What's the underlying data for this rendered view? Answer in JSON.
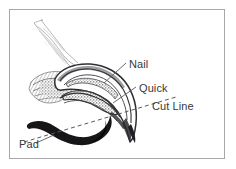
{
  "figure": {
    "background_color": "#ffffff",
    "frame_color": "#a8a8a8",
    "ink_color": "#39393c",
    "labels": {
      "nail": "Nail",
      "quick": "Quick",
      "cut_line": "Cut Line",
      "pad": "Pad"
    },
    "parts": {
      "nail_icon": "nail-shell-outline",
      "quick_icon": "quick-stippled-wedge",
      "cut_line_icon": "dashed-cut-line",
      "pad_icon": "paw-pad-solid-shape",
      "leg_icon": "leg-shaft-sketch"
    }
  }
}
